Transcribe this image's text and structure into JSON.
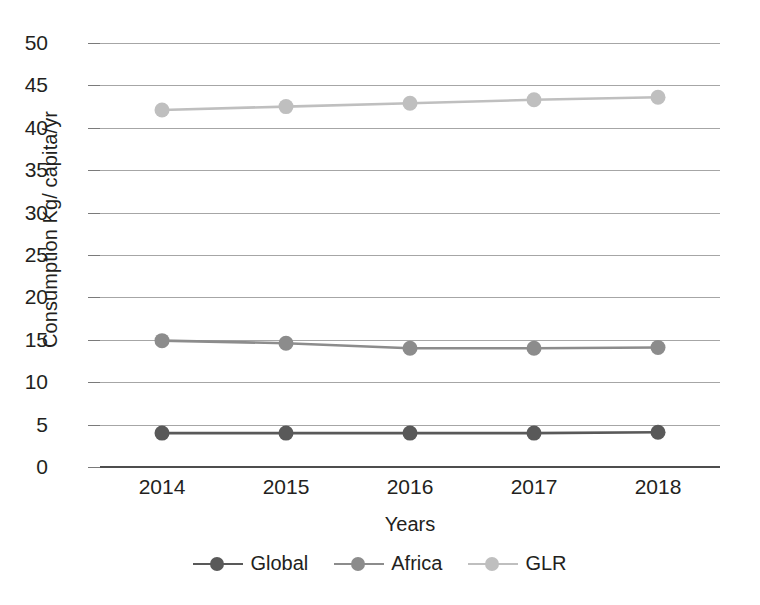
{
  "chart_data": {
    "type": "line",
    "title": "",
    "xlabel": "Years",
    "ylabel": "Consumption Kg/ capita/yr",
    "categories": [
      "2014",
      "2015",
      "2016",
      "2017",
      "2018"
    ],
    "ylim": [
      0,
      50
    ],
    "yticks": [
      "0",
      "5",
      "10",
      "15",
      "20",
      "25",
      "30",
      "35",
      "40",
      "45",
      "50"
    ],
    "grid": true,
    "legend_position": "bottom",
    "series": [
      {
        "name": "Global",
        "color": "#595959",
        "values": [
          4.0,
          4.0,
          4.0,
          4.0,
          4.1
        ]
      },
      {
        "name": "Africa",
        "color": "#8c8c8c",
        "values": [
          14.9,
          14.6,
          14.0,
          14.0,
          14.1
        ]
      },
      {
        "name": "GLR",
        "color": "#bfbfbf",
        "values": [
          42.1,
          42.5,
          42.9,
          43.3,
          43.6
        ]
      }
    ]
  },
  "colors": {
    "axis": "#4d4d4d",
    "grid": "#a6a6a6",
    "text": "#231f20",
    "background": "#ffffff"
  }
}
